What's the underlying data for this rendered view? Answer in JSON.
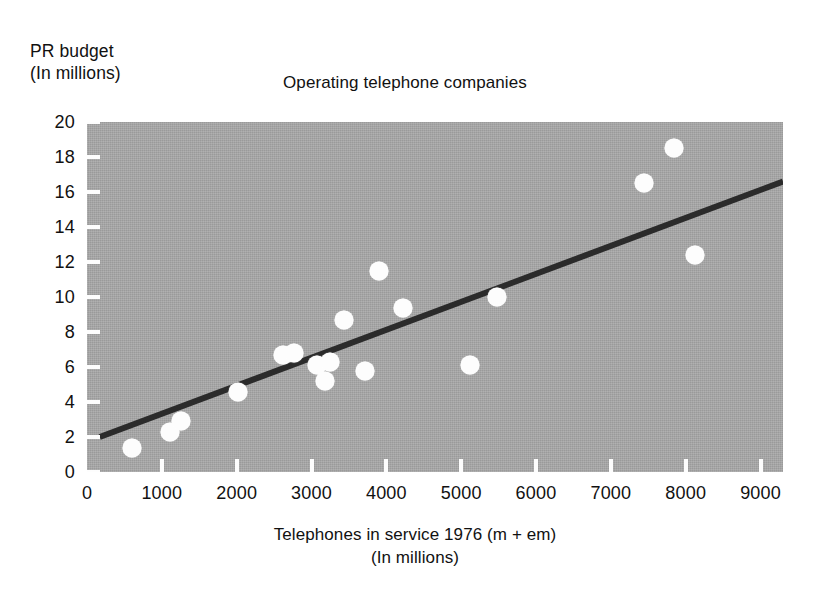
{
  "chart_data": {
    "type": "scatter",
    "title": "Operating telephone companies",
    "ylabel_line1": "PR budget",
    "ylabel_line2": "(In millions)",
    "xlabel_line1": "Telephones in service 1976 (m + em)",
    "xlabel_line2": "(In millions)",
    "xlim": [
      0,
      9300
    ],
    "ylim": [
      0,
      20
    ],
    "grid": false,
    "legend": null,
    "xticks": [
      0,
      1000,
      2000,
      3000,
      4000,
      5000,
      6000,
      7000,
      8000,
      9000
    ],
    "xtick_labels": [
      "0",
      "1000",
      "2000",
      "3000",
      "4000",
      "5000",
      "6000",
      "7000",
      "8000",
      "9000"
    ],
    "yticks": [
      0,
      2,
      4,
      6,
      8,
      10,
      12,
      14,
      16,
      18,
      20
    ],
    "ytick_labels": [
      "0",
      "2",
      "4",
      "6",
      "8",
      "10",
      "12",
      "14",
      "16",
      "18",
      "20"
    ],
    "points": [
      {
        "x": 600,
        "y": 1.4
      },
      {
        "x": 1110,
        "y": 2.3
      },
      {
        "x": 1250,
        "y": 2.9
      },
      {
        "x": 2020,
        "y": 4.6
      },
      {
        "x": 2620,
        "y": 6.7
      },
      {
        "x": 2760,
        "y": 6.8
      },
      {
        "x": 3070,
        "y": 6.1
      },
      {
        "x": 3180,
        "y": 5.2
      },
      {
        "x": 3250,
        "y": 6.3
      },
      {
        "x": 3440,
        "y": 8.7
      },
      {
        "x": 3720,
        "y": 5.8
      },
      {
        "x": 3900,
        "y": 11.5
      },
      {
        "x": 4220,
        "y": 9.4
      },
      {
        "x": 5120,
        "y": 6.1
      },
      {
        "x": 5480,
        "y": 10.0
      },
      {
        "x": 7440,
        "y": 16.5
      },
      {
        "x": 7850,
        "y": 18.5
      },
      {
        "x": 8130,
        "y": 12.4
      }
    ],
    "trendline": {
      "label": "regression-line",
      "x0": 170,
      "y0": 2.0,
      "x1": 9300,
      "y1": 16.6
    },
    "colors": {
      "plot_background": "#a8a8a8",
      "marker": "#fdfdfd",
      "trendline": "#2b2b2b",
      "text": "#111111",
      "page_background": "#ffffff"
    }
  }
}
